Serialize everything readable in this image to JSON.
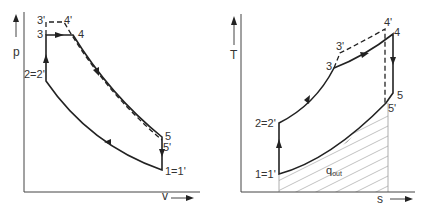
{
  "colors": {
    "line": "#222222",
    "axis": "#444444",
    "hatch": "#999999",
    "text": "#333333"
  },
  "pv_diagram": {
    "y_axis_label": "p",
    "x_axis_label": "v",
    "points": {
      "p3prime": "3'",
      "p4prime": "4'",
      "p3": "3",
      "p4": "4",
      "p2": "2=2'",
      "p5": "5",
      "p5prime": "5'",
      "p1": "1=1'"
    }
  },
  "ts_diagram": {
    "y_axis_label": "T",
    "x_axis_label": "s",
    "heat_out_label": "q",
    "heat_out_subscript": "out",
    "points": {
      "p2": "2=2'",
      "p1": "1=1'",
      "p3": "3",
      "p3prime": "3'",
      "p4prime": "4'",
      "p4": "4",
      "p5": "5",
      "p5prime": "5'"
    }
  }
}
